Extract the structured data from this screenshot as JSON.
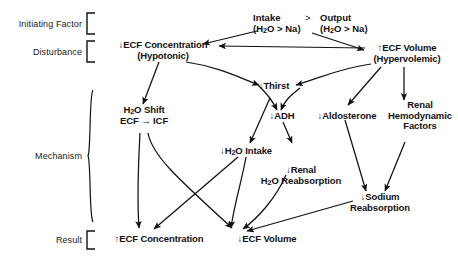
{
  "figure": {
    "type": "flowchart",
    "orientation": "top-to-bottom"
  },
  "stages": [
    {
      "id": "initiating-factor",
      "label": "Initiating Factor"
    },
    {
      "id": "disturbance",
      "label": "Disturbance"
    },
    {
      "id": "mechanism",
      "label": "Mechanism"
    },
    {
      "id": "result",
      "label": "Result"
    }
  ],
  "nodes": {
    "intake": {
      "line1": "Intake",
      "line2_pre": "(H",
      "line2_sub": "2",
      "line2_post": "O > Na)"
    },
    "operator": ">",
    "output": {
      "line1": "Output",
      "line2_pre": "(H",
      "line2_sub": "2",
      "line2_post": "O > Na)"
    },
    "ecf_concentration_down": {
      "line1": "↓ECF Concentration",
      "line2": "(Hypotonic)"
    },
    "ecf_volume_up": {
      "line1": "↑ECF Volume",
      "line2": "(Hypervolemic)"
    },
    "thirst_down": {
      "line1": "↓Thirst"
    },
    "adh_down": {
      "line1": "↓ADH"
    },
    "aldosterone_down": {
      "line1": "↓Aldosterone"
    },
    "renal_hemodynamic": {
      "line1": "Renal",
      "line2": "Hemodynamic",
      "line3": "Factors"
    },
    "h2o_shift": {
      "line1_pre": "H",
      "line1_sub": "2",
      "line1_post": "O Shift",
      "line2": "ECF → ICF"
    },
    "h2o_intake_down": {
      "pre": "↓H",
      "sub": "2",
      "post": "O Intake"
    },
    "renal_h2o_reabsorption_down": {
      "line1": "↓Renal",
      "line2_pre": "H",
      "line2_sub": "2",
      "line2_post": "O Reabsorption"
    },
    "sodium_reabsorption_down": {
      "line1": "↓Sodium",
      "line2": "Reabsorption"
    },
    "ecf_concentration_up": {
      "line1": "↑ECF Concentration"
    },
    "ecf_volume_down": {
      "line1": "↓ECF Volume"
    }
  },
  "edges": [
    {
      "from": "intake",
      "to": "ecf_concentration_down"
    },
    {
      "from": "output",
      "to": "ecf_volume_up"
    },
    {
      "from": "ecf_volume_up",
      "to": "ecf_concentration_down"
    },
    {
      "from": "ecf_volume_up",
      "to": "thirst_down"
    },
    {
      "from": "ecf_volume_up",
      "to": "aldosterone_down"
    },
    {
      "from": "ecf_volume_up",
      "to": "renal_hemodynamic"
    },
    {
      "from": "ecf_concentration_down",
      "to": "thirst_down"
    },
    {
      "from": "ecf_concentration_down",
      "to": "h2o_shift"
    },
    {
      "from": "ecf_concentration_down",
      "to": "adh_down"
    },
    {
      "from": "thirst_down",
      "to": "h2o_intake_down"
    },
    {
      "from": "adh_down",
      "to": "renal_h2o_reabsorption_down"
    },
    {
      "from": "aldosterone_down",
      "to": "sodium_reabsorption_down"
    },
    {
      "from": "renal_hemodynamic",
      "to": "sodium_reabsorption_down"
    },
    {
      "from": "h2o_shift",
      "to": "ecf_volume_down"
    },
    {
      "from": "h2o_shift",
      "to": "ecf_concentration_up"
    },
    {
      "from": "h2o_intake_down",
      "to": "ecf_concentration_up"
    },
    {
      "from": "h2o_intake_down",
      "to": "ecf_volume_down"
    },
    {
      "from": "renal_h2o_reabsorption_down",
      "to": "ecf_volume_down"
    },
    {
      "from": "sodium_reabsorption_down",
      "to": "ecf_volume_down"
    }
  ],
  "colors": {
    "ink": "#111111",
    "background": "#ffffff"
  }
}
